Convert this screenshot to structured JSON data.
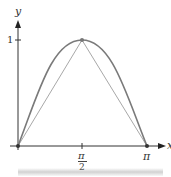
{
  "diagram": {
    "title": "",
    "axes": {
      "x_label": "x",
      "y_label": "y",
      "x_ticks": [
        {
          "value": "π/2",
          "numerator": "π",
          "denominator": "2"
        },
        {
          "value": "π",
          "label": "π"
        }
      ],
      "y_ticks": [
        {
          "value": 1,
          "label": "1"
        }
      ]
    },
    "curve": {
      "function": "sin(x)",
      "domain": [
        "0",
        "π"
      ],
      "color": "#7a7a7a"
    },
    "triangle": {
      "vertices": [
        [
          "0",
          "0"
        ],
        [
          "π/2",
          "1"
        ],
        [
          "π",
          "0"
        ]
      ],
      "color": "#a8a8a8"
    },
    "points": [
      [
        "0",
        "0"
      ],
      [
        "π/2",
        "1"
      ],
      [
        "π",
        "0"
      ]
    ],
    "axis_color": "#333333"
  }
}
